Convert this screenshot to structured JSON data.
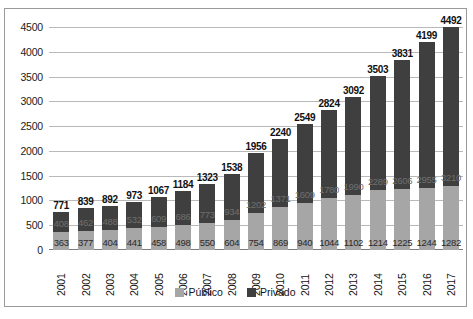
{
  "chart_data": {
    "type": "bar",
    "stacked": true,
    "title": "",
    "xlabel": "",
    "ylabel": "",
    "ylim": [
      0,
      4500
    ],
    "yticks": [
      0,
      500,
      1000,
      1500,
      2000,
      2500,
      3000,
      3500,
      4000,
      4500
    ],
    "grid": true,
    "legend_position": "bottom",
    "categories": [
      "2001",
      "2002",
      "2003",
      "2004",
      "2005",
      "2006",
      "2007",
      "2008",
      "2009",
      "2010",
      "2011",
      "2012",
      "2013",
      "2014",
      "2015",
      "2016",
      "2017"
    ],
    "series": [
      {
        "name": "Público",
        "color": "#a6a6a6",
        "values": [
          363,
          377,
          404,
          441,
          458,
          498,
          550,
          604,
          754,
          869,
          940,
          1044,
          1102,
          1214,
          1225,
          1244,
          1282
        ]
      },
      {
        "name": "Privado",
        "color": "#3f3f3f",
        "values": [
          408,
          462,
          488,
          532,
          609,
          686,
          773,
          934,
          1202,
          1371,
          1609,
          1780,
          1990,
          2289,
          2606,
          2955,
          3210
        ]
      }
    ],
    "totals": [
      771,
      839,
      892,
      973,
      1067,
      1184,
      1323,
      1538,
      1956,
      2240,
      2549,
      2824,
      3092,
      3503,
      3831,
      4199,
      4492
    ]
  },
  "legend": {
    "items": [
      {
        "label": "Público",
        "color": "#a6a6a6"
      },
      {
        "label": "Privado",
        "color": "#3f3f3f"
      }
    ]
  },
  "caption": ""
}
